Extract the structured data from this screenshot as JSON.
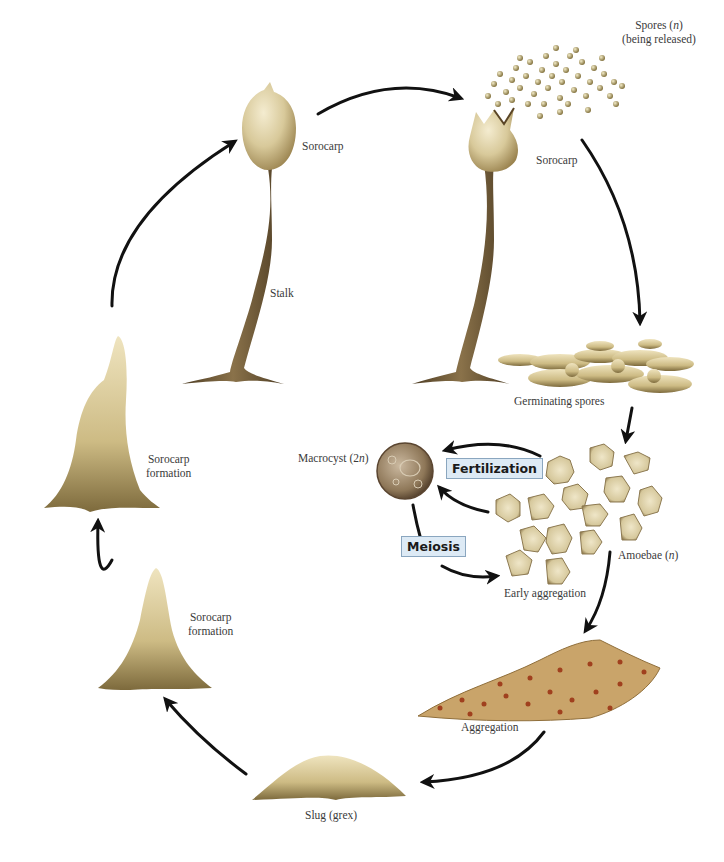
{
  "diagram": {
    "stages": [
      {
        "id": "sorocarp-mature",
        "label": "Sorocarp"
      },
      {
        "id": "stalk",
        "label": "Stalk"
      },
      {
        "id": "sorocarp-releasing",
        "label": "Sorocarp"
      },
      {
        "id": "spores",
        "label_main": "Spores (",
        "label_italic": "n",
        "label_end": ")",
        "label_line2": "(being released)"
      },
      {
        "id": "germinating-spores",
        "label": "Germinating spores"
      },
      {
        "id": "amoebae",
        "label_main": "Amoebae (",
        "label_italic": "n",
        "label_end": ")"
      },
      {
        "id": "early-aggregation",
        "label": "Early aggregation"
      },
      {
        "id": "macrocyst",
        "label_main": "Macrocyst (2",
        "label_italic": "n",
        "label_end": ")"
      },
      {
        "id": "aggregation",
        "label": "Aggregation"
      },
      {
        "id": "slug",
        "label": "Slug (grex)"
      },
      {
        "id": "sorocarp-formation-early",
        "label_line1": "Sorocarp",
        "label_line2": "formation"
      },
      {
        "id": "sorocarp-formation-late",
        "label_line1": "Sorocarp",
        "label_line2": "formation"
      }
    ],
    "process_labels": {
      "fertilization": "Fertilization",
      "meiosis": "Meiosis"
    },
    "colors": {
      "cell_body": "#d8c99a",
      "cell_shadow": "#a08a52",
      "stalk": "#6b5636",
      "macrocyst": "#8a7358",
      "aggregation": "#c9a46a",
      "nucleus": "#a0401e",
      "arrow": "#111111",
      "box_fill": "#ddeaf5",
      "box_border": "#8aa6bf"
    }
  }
}
